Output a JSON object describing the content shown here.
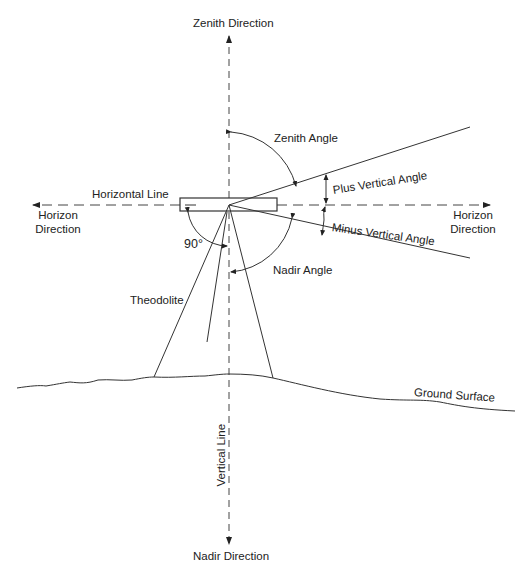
{
  "diagram": {
    "type": "theodolite-angle-definitions",
    "labels": {
      "zenith_direction": "Zenith Direction",
      "nadir_direction": "Nadir Direction",
      "horizontal_line": "Horizontal Line",
      "horizon_direction_left_1": "Horizon",
      "horizon_direction_left_2": "Direction",
      "horizon_direction_right_1": "Horizon",
      "horizon_direction_right_2": "Direction",
      "zenith_angle": "Zenith Angle",
      "plus_vertical_angle": "Plus Vertical Angle",
      "minus_vertical_angle": "Minus Vertical Angle",
      "nadir_angle": "Nadir Angle",
      "right_angle": "90°",
      "theodolite": "Theodolite",
      "ground_surface": "Ground Surface",
      "vertical_line": "Vertical Line"
    },
    "colors": {
      "line": "#333333",
      "background": "#ffffff"
    }
  }
}
